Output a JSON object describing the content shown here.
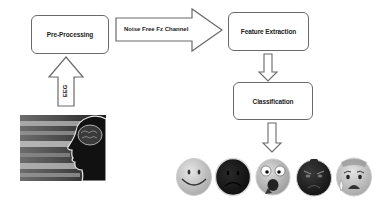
{
  "diagram": {
    "nodes": {
      "preprocessing": {
        "label": "Pre-Processing"
      },
      "feature_extraction": {
        "label": "Feature Extraction"
      },
      "classification": {
        "label": "Classification"
      }
    },
    "edges": {
      "noise_free": {
        "label": "Noise Free Fz  Channel"
      },
      "eeg": {
        "label": "EEG"
      }
    },
    "input_image": {
      "description": "eeg-brain-head-silhouette"
    },
    "output_emotions": [
      {
        "name": "happy"
      },
      {
        "name": "sad"
      },
      {
        "name": "shocked"
      },
      {
        "name": "angry"
      },
      {
        "name": "anxious"
      }
    ],
    "colors": {
      "stroke": "#6a6a6a",
      "text": "#222222",
      "background": "#ffffff"
    }
  }
}
